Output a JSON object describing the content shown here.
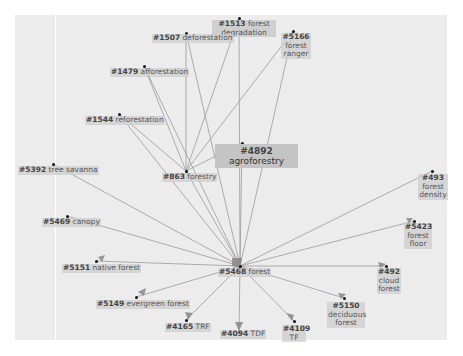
{
  "graph": {
    "center_node": {
      "id": "#5468",
      "label": "forest"
    },
    "nodes": [
      {
        "key": "n1513",
        "id": "#1513",
        "label": "forest degradation"
      },
      {
        "key": "n1507",
        "id": "#1507",
        "label": "deforestation"
      },
      {
        "key": "n5166",
        "id": "#5166",
        "label": "forest ranger"
      },
      {
        "key": "n1479",
        "id": "#1479",
        "label": "afforestation"
      },
      {
        "key": "n1544",
        "id": "#1544",
        "label": "reforestation"
      },
      {
        "key": "n4892",
        "id": "#4892",
        "label": "agroforestry"
      },
      {
        "key": "n5392",
        "id": "#5392",
        "label": "tree savanna"
      },
      {
        "key": "n863",
        "id": "#863",
        "label": "forestry"
      },
      {
        "key": "n493",
        "id": "#493",
        "label": "forest density"
      },
      {
        "key": "n5469",
        "id": "#5469",
        "label": "canopy"
      },
      {
        "key": "n5423",
        "id": "#5423",
        "label": "forest floor"
      },
      {
        "key": "n5151",
        "id": "#5151",
        "label": "native forest"
      },
      {
        "key": "n5468",
        "id": "#5468",
        "label": "forest"
      },
      {
        "key": "n492",
        "id": "#492",
        "label": "cloud forest"
      },
      {
        "key": "n5149",
        "id": "#5149",
        "label": "evergreen forest"
      },
      {
        "key": "n5150",
        "id": "#5150",
        "label": "deciduous forest"
      },
      {
        "key": "n4165",
        "id": "#4165",
        "label": "TRF"
      },
      {
        "key": "n4094",
        "id": "#4094",
        "label": "TDF"
      },
      {
        "key": "n4109",
        "id": "#4109",
        "label": "TF"
      }
    ],
    "edges": [
      [
        "#863",
        "#1507"
      ],
      [
        "#863",
        "#1513"
      ],
      [
        "#863",
        "#5166"
      ],
      [
        "#863",
        "#1479"
      ],
      [
        "#863",
        "#1544"
      ],
      [
        "#863",
        "#4892"
      ],
      [
        "#5468",
        "#1507"
      ],
      [
        "#5468",
        "#1513"
      ],
      [
        "#5468",
        "#5166"
      ],
      [
        "#5468",
        "#1479"
      ],
      [
        "#5468",
        "#1544"
      ],
      [
        "#5468",
        "#4892"
      ],
      [
        "#5468",
        "#863"
      ],
      [
        "#5468",
        "#5392"
      ],
      [
        "#5468",
        "#5469"
      ],
      [
        "#5468",
        "#5151"
      ],
      [
        "#5468",
        "#493"
      ],
      [
        "#5468",
        "#5423"
      ],
      [
        "#5468",
        "#492"
      ],
      [
        "#5468",
        "#5149"
      ],
      [
        "#5468",
        "#5150"
      ],
      [
        "#5468",
        "#4165"
      ],
      [
        "#5468",
        "#4094"
      ],
      [
        "#5468",
        "#4109"
      ]
    ],
    "colors": {
      "edge": "#9a9a9a",
      "panel": "#ececec",
      "label_bg": "#cdcdcd",
      "highlight_bg": "#c4c4c4",
      "dot": "#111111"
    }
  }
}
